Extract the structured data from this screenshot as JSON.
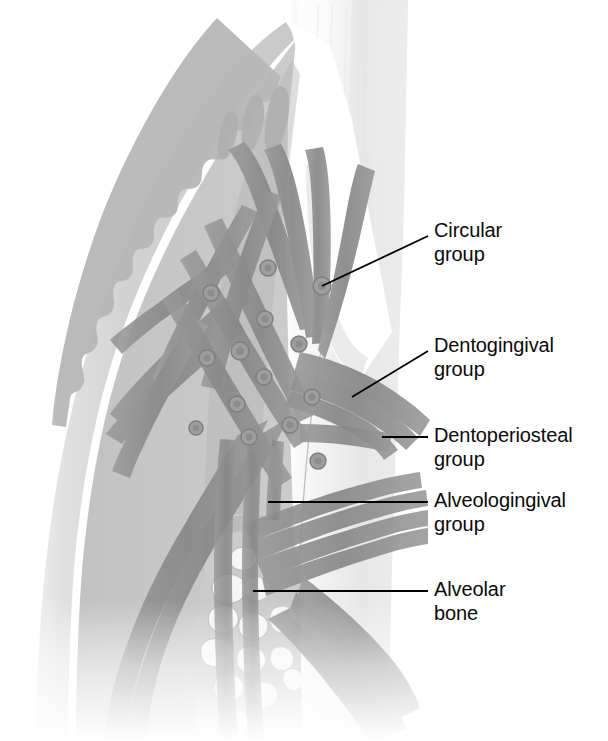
{
  "figure": {
    "type": "anatomical-illustration",
    "width": 608,
    "height": 741,
    "background_color": "#ffffff"
  },
  "labels": [
    {
      "id": "circular",
      "line1": "Circular",
      "line2": "group",
      "text_x": 434,
      "text_y": 228,
      "leader": {
        "x1": 428,
        "y1": 236,
        "x2": 322,
        "y2": 286,
        "style": "diagonal"
      }
    },
    {
      "id": "dentogingival",
      "line1": "Dentogingival",
      "line2": "group",
      "text_x": 434,
      "text_y": 343,
      "leader": {
        "x1": 428,
        "y1": 351,
        "x2": 352,
        "y2": 397,
        "style": "diagonal"
      }
    },
    {
      "id": "dentoperiosteal",
      "line1": "Dentoperiosteal",
      "line2": "group",
      "text_x": 434,
      "text_y": 426,
      "leader": {
        "x1": 428,
        "y1": 437,
        "x2": 382,
        "y2": 437,
        "style": "horizontal"
      }
    },
    {
      "id": "alveologingival",
      "line1": "Alveologingival",
      "line2": "group",
      "text_x": 434,
      "text_y": 492,
      "leader": {
        "x1": 428,
        "y1": 502,
        "x2": 268,
        "y2": 502,
        "style": "horizontal"
      }
    },
    {
      "id": "alveolar-bone",
      "line1": "Alveolar",
      "line2": "bone",
      "text_x": 434,
      "text_y": 580,
      "leader": {
        "x1": 428,
        "y1": 591,
        "x2": 253,
        "y2": 591,
        "style": "horizontal"
      }
    }
  ],
  "structures": {
    "gingiva_epithelium": {
      "name": "Gingival epithelium",
      "color": "#cfcfcf"
    },
    "gingiva_connective": {
      "name": "Gingival connective tissue",
      "color": "#bdbdbd"
    },
    "rete_ridges": {
      "name": "Rete ridge wavy junction",
      "color": "#a8a8a8"
    },
    "enamel": {
      "name": "Enamel",
      "color": "#fbfbfb"
    },
    "dentin": {
      "name": "Dentin / tooth body",
      "color": "#e2e2e2"
    },
    "sulcus": {
      "name": "Gingival sulcus",
      "color": "#ffffff"
    },
    "fiber_bundles": {
      "name": "Gingival fiber bundles",
      "color": "#8e8e8e"
    },
    "fiber_cross_sections": {
      "name": "Circular fibers in cross section",
      "color": "#9a9a9a"
    },
    "alveolar_bone": {
      "name": "Alveolar bone trabeculae",
      "color": "#c4c4c4"
    },
    "marrow_space": {
      "name": "Marrow spaces",
      "color": "#f4f4f4"
    },
    "leader_line_color": "#000000",
    "label_text_color": "#0a0a0a"
  },
  "fiber_cross_section_points": [
    [
      322,
      286
    ],
    [
      268,
      268
    ],
    [
      211,
      293
    ],
    [
      240,
      351
    ],
    [
      264,
      377
    ],
    [
      237,
      404
    ],
    [
      207,
      358
    ],
    [
      265,
      319
    ],
    [
      299,
      344
    ],
    [
      312,
      397
    ],
    [
      290,
      425
    ],
    [
      318,
      461
    ],
    [
      249,
      437
    ],
    [
      196,
      428
    ]
  ]
}
